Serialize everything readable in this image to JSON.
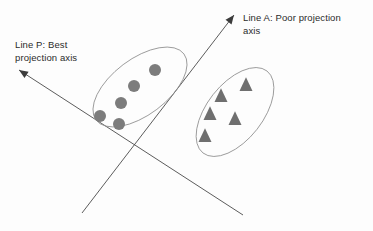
{
  "figure": {
    "background_color": "#fdfdfd",
    "width": 373,
    "height": 231
  },
  "labels": {
    "line_p": {
      "text": "Line P: Best\nprojection axis",
      "line1": "Line P: Best",
      "line2": "projection axis",
      "color": "#2b2b2b"
    },
    "line_a": {
      "text": "Line A: Poor projection\naxis",
      "line1": "Line A: Poor projection",
      "line2": "axis",
      "color": "#2b2b2b"
    }
  },
  "axes": {
    "line_p": {
      "name": "Line P",
      "description": "Best projection axis",
      "color": "#4a4a4a",
      "x1": 19,
      "y1": 70,
      "x2": 243,
      "y2": 215,
      "arrow_at": "start"
    },
    "line_a": {
      "name": "Line A",
      "description": "Poor projection axis",
      "color": "#4a4a4a",
      "x1": 234,
      "y1": 15,
      "x2": 82,
      "y2": 213,
      "arrow_at": "start"
    }
  },
  "clusters": [
    {
      "name": "circle-cluster",
      "marker": "circle",
      "marker_color": "#7c7c7c",
      "outline_color": "#8e8e8e",
      "ellipse": {
        "cx": 140,
        "cy": 87,
        "rx": 55,
        "ry": 28,
        "rotation": -37
      },
      "points": [
        {
          "x": 155,
          "y": 70,
          "r": 6
        },
        {
          "x": 134,
          "y": 86,
          "r": 6
        },
        {
          "x": 121,
          "y": 103,
          "r": 6
        },
        {
          "x": 100,
          "y": 116,
          "r": 6
        },
        {
          "x": 119,
          "y": 124,
          "r": 6
        }
      ]
    },
    {
      "name": "triangle-cluster",
      "marker": "triangle",
      "marker_color": "#6f6f6f",
      "outline_color": "#8e8e8e",
      "ellipse": {
        "cx": 235,
        "cy": 112,
        "rx": 52,
        "ry": 28,
        "rotation": -52
      },
      "points": [
        {
          "x": 246,
          "y": 84,
          "s": 11
        },
        {
          "x": 221,
          "y": 95,
          "s": 11
        },
        {
          "x": 210,
          "y": 113,
          "s": 11
        },
        {
          "x": 235,
          "y": 118,
          "s": 11
        },
        {
          "x": 205,
          "y": 135,
          "s": 11
        }
      ]
    }
  ]
}
